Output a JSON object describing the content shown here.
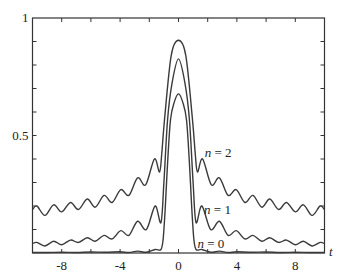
{
  "chart_data": {
    "type": "line",
    "title": "",
    "xlabel": "t",
    "ylabel": "",
    "xlim": [
      -10,
      10
    ],
    "ylim": [
      0,
      1
    ],
    "grid": false,
    "legend": "inline labels",
    "x_ticks": [
      -8,
      -4,
      0,
      4,
      8
    ],
    "x_tick_labels": [
      "-8",
      "-4",
      "0",
      "4",
      "8"
    ],
    "x_minor_ticks": [
      -10,
      -8,
      -6,
      -4,
      -2,
      0,
      2,
      4,
      6,
      8,
      10
    ],
    "y_ticks": [
      0.5,
      1
    ],
    "y_tick_labels": [
      "0.5",
      "1"
    ],
    "y_minor_ticks": [
      0.1,
      0.2,
      0.3,
      0.4,
      0.5,
      0.6,
      0.7,
      0.8,
      0.9
    ],
    "symmetric_about_zero": true,
    "series": [
      {
        "name": "n = 2",
        "label_n": "n",
        "label_rest": " = 2",
        "label_pos": {
          "t": 1.8,
          "v": 0.41
        },
        "points_right": [
          [
            0,
            0.905
          ],
          [
            0.5,
            0.84
          ],
          [
            0.96,
            0.566
          ],
          [
            1.15,
            0.42
          ],
          [
            1.3,
            0.345
          ],
          [
            1.65,
            0.4
          ],
          [
            2.25,
            0.29
          ],
          [
            2.8,
            0.32
          ],
          [
            3.4,
            0.245
          ],
          [
            3.95,
            0.27
          ],
          [
            4.55,
            0.215
          ],
          [
            5.1,
            0.245
          ],
          [
            5.7,
            0.195
          ],
          [
            6.25,
            0.23
          ],
          [
            6.85,
            0.185
          ],
          [
            7.4,
            0.215
          ],
          [
            8.0,
            0.175
          ],
          [
            8.55,
            0.205
          ],
          [
            9.15,
            0.16
          ],
          [
            9.7,
            0.2
          ],
          [
            10,
            0.185
          ]
        ]
      },
      {
        "name": "n = 1",
        "label_n": "n",
        "label_rest": " = 1",
        "label_pos": {
          "t": 1.75,
          "v": 0.165
        },
        "points_right": [
          [
            0,
            0.826
          ],
          [
            0.45,
            0.72
          ],
          [
            0.75,
            0.566
          ],
          [
            1.0,
            0.3
          ],
          [
            1.2,
            0.13
          ],
          [
            1.6,
            0.2
          ],
          [
            2.2,
            0.1
          ],
          [
            2.8,
            0.135
          ],
          [
            3.4,
            0.075
          ],
          [
            3.95,
            0.095
          ],
          [
            4.55,
            0.06
          ],
          [
            5.1,
            0.075
          ],
          [
            5.7,
            0.05
          ],
          [
            6.25,
            0.065
          ],
          [
            6.85,
            0.045
          ],
          [
            7.4,
            0.055
          ],
          [
            8.0,
            0.035
          ],
          [
            8.55,
            0.05
          ],
          [
            9.15,
            0.03
          ],
          [
            9.7,
            0.045
          ],
          [
            10,
            0.04
          ]
        ]
      },
      {
        "name": "n = 0",
        "label_n": "n",
        "label_rest": " = 0",
        "label_pos": {
          "t": 1.3,
          "v": 0.02
        },
        "points_right": [
          [
            0,
            0.677
          ],
          [
            0.3,
            0.64
          ],
          [
            0.55,
            0.566
          ],
          [
            0.75,
            0.38
          ],
          [
            0.9,
            0.2
          ],
          [
            1.05,
            0.06
          ],
          [
            1.2,
            0.015
          ],
          [
            1.6,
            0.015
          ],
          [
            2.2,
            0.003
          ],
          [
            2.8,
            0.008
          ],
          [
            3.4,
            0.002
          ],
          [
            4,
            0.005
          ],
          [
            5,
            0.003
          ],
          [
            6,
            0.004
          ],
          [
            7,
            0.002
          ],
          [
            8,
            0.003
          ],
          [
            9,
            0.002
          ],
          [
            10,
            0.002
          ]
        ]
      }
    ]
  },
  "colors": {
    "background": "#ffffff",
    "curve": "#3a3a3a",
    "axis": "#333333"
  }
}
